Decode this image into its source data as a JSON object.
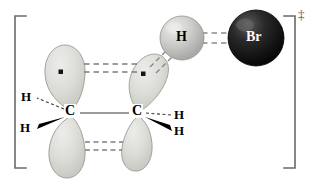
{
  "figure": {
    "notation": "double-dagger",
    "bracket_superscript": "‡",
    "background_color": "#ffffff"
  },
  "colors": {
    "orbital_fill": "#d8d8d2",
    "orbital_fill_light": "#e8e8e4",
    "orbital_stroke": "#8a8a86",
    "sphere_h_fill": "#c9c9c6",
    "sphere_h_light": "#e4e4e2",
    "sphere_h_stroke": "#8f8f8c",
    "sphere_br_fill": "#111111",
    "sphere_br_light": "#4a4a4a",
    "sphere_br_stroke": "#000000",
    "bond_solid": "#6e6e6e",
    "bond_dashed": "#7a7a7a",
    "wedge_fill": "#000000",
    "bracket": "#6a6a6a",
    "text_dark": "#000000",
    "text_light": "#ffffff",
    "electron_dot": "#111111"
  },
  "atoms": {
    "carbon_left": {
      "label": "C",
      "x": 71,
      "y": 113
    },
    "carbon_right": {
      "label": "C",
      "x": 138,
      "y": 113
    },
    "hydrogen_left_back": {
      "label": "H",
      "x": 26,
      "y": 98
    },
    "hydrogen_left_wedge": {
      "label": "H",
      "x": 25,
      "y": 127
    },
    "hydrogen_right_back": {
      "label": "H",
      "x": 180,
      "y": 116
    },
    "hydrogen_right_wedge": {
      "label": "H",
      "x": 180,
      "y": 132
    },
    "hydrogen_sphere": {
      "label": "H",
      "x": 182,
      "y": 38,
      "radius": 22
    },
    "bromine_sphere": {
      "label": "Br",
      "x": 256,
      "y": 38,
      "radius": 28
    }
  },
  "orbitals": [
    {
      "name": "left-p-orbital-upper-lobe",
      "has_electron": true,
      "electron_x": 61,
      "electron_y": 72
    },
    {
      "name": "left-p-orbital-lower-lobe",
      "has_electron": false
    },
    {
      "name": "right-p-orbital-upper-lobe",
      "has_electron": true,
      "electron_x": 143,
      "electron_y": 74
    },
    {
      "name": "right-p-orbital-lower-lobe",
      "has_electron": false
    }
  ],
  "bonds": {
    "c_c_sigma": {
      "type": "solid",
      "from": "carbon_left",
      "to": "carbon_right"
    },
    "upper_pi_overlap": {
      "type": "double-dashed",
      "description": "partial pi bond between upper p lobes"
    },
    "lower_pi_overlap": {
      "type": "double-dashed",
      "description": "partial pi bond between lower p lobes"
    },
    "c_h_breaking": {
      "type": "double-dashed",
      "description": "partially broken C-H bond to migrating hydrogen"
    },
    "h_br_forming": {
      "type": "double-dashed",
      "description": "partially formed H-Br bond"
    },
    "h_left_back": {
      "type": "hashed",
      "description": "receding bond"
    },
    "h_left_wedge": {
      "type": "wedge",
      "description": "protruding bond"
    },
    "h_right_back": {
      "type": "hashed",
      "description": "receding bond"
    },
    "h_right_wedge": {
      "type": "wedge",
      "description": "protruding bond"
    }
  }
}
